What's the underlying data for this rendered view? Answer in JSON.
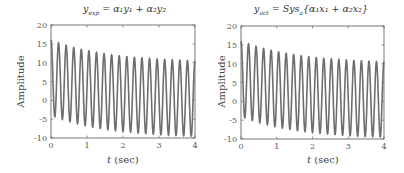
{
  "chart_data": [
    {
      "type": "line",
      "title": "y_exp = α₁y₁ + α₂y₂",
      "xlabel": "t (sec)",
      "ylabel": "Amplitude",
      "xlim": [
        0,
        4
      ],
      "ylim": [
        -10,
        20
      ],
      "xticks": [
        "0",
        "1",
        "2",
        "3",
        "4"
      ],
      "yticks": [
        "-10",
        "-5",
        "0",
        "5",
        "10",
        "15",
        "20"
      ],
      "grid": false,
      "series": [
        {
          "name": "y_exp",
          "color": "#6e6e6e",
          "description": "Oscillating signal ~4.75 Hz, amplitude ~10, offset decaying from ~6 to ~0.5",
          "frequency_hz": 4.75,
          "amplitude": 10,
          "offset_start": 6,
          "offset_end": 0.5,
          "peaks_approx": [
            16,
            15.5,
            15,
            14.6,
            14.2,
            13.8,
            13.5,
            13.2,
            12.9,
            12.6,
            12.3,
            12.1,
            11.9,
            11.6,
            11.4,
            11.2,
            11,
            10.8,
            10.6,
            10.5
          ],
          "troughs_approx": [
            -4,
            -4.5,
            -5,
            -5.4,
            -5.8,
            -6.2,
            -6.5,
            -6.8,
            -7.1,
            -7.4,
            -7.7,
            -7.9,
            -8.1,
            -8.4,
            -8.6,
            -8.8,
            -9,
            -9.2,
            -9.4
          ]
        }
      ]
    },
    {
      "type": "line",
      "title": "y_act = Sys_a{α₁x₁ + α₂x₂}",
      "xlabel": "t (sec)",
      "ylabel": "Amplitude",
      "xlim": [
        0,
        4
      ],
      "ylim": [
        -10,
        20
      ],
      "xticks": [
        "0",
        "1",
        "2",
        "3",
        "4"
      ],
      "yticks": [
        "-10",
        "-5",
        "0",
        "5",
        "10",
        "15",
        "20"
      ],
      "grid": false,
      "series": [
        {
          "name": "y_act",
          "color": "#6e6e6e",
          "description": "Identical to y_exp: oscillating signal ~4.75 Hz, amplitude ~10, offset decaying from ~6 to ~0.5",
          "frequency_hz": 4.75,
          "amplitude": 10,
          "offset_start": 6,
          "offset_end": 0.5,
          "peaks_approx": [
            16,
            15.5,
            15,
            14.6,
            14.2,
            13.8,
            13.5,
            13.2,
            12.9,
            12.6,
            12.3,
            12.1,
            11.9,
            11.6,
            11.4,
            11.2,
            11,
            10.8,
            10.6,
            10.5
          ],
          "troughs_approx": [
            -4,
            -4.5,
            -5,
            -5.4,
            -5.8,
            -6.2,
            -6.5,
            -6.8,
            -7.1,
            -7.4,
            -7.7,
            -7.9,
            -8.1,
            -8.4,
            -8.6,
            -8.8,
            -9,
            -9.2,
            -9.4
          ]
        }
      ]
    }
  ],
  "panels": [
    {
      "title_main": "y",
      "title_sub": "exp",
      "title_rest": " = α₁y₁ + α₂y₂",
      "xlabel": "t (sec)",
      "ylabel": "Amplitude"
    },
    {
      "title_main": "y",
      "title_sub": "act",
      "title_rest": " = Sys",
      "title_sub2": "a",
      "title_rest2": "{α₁x₁ + α₂x₂}",
      "xlabel": "t (sec)",
      "ylabel": "Amplitude"
    }
  ]
}
